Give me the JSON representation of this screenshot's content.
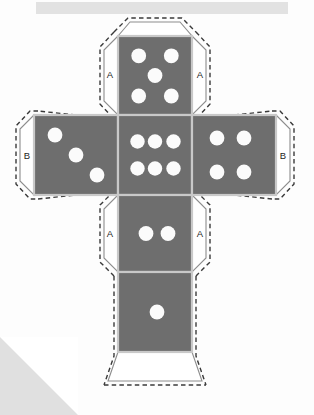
{
  "document": {
    "title": "Dice Cube Net Cut-Out",
    "description": "Unfolded net of a six-sided die with glue flaps labelled A and B",
    "background_color": "#fdfdfd",
    "face_color": "#6e6e6e",
    "pip_color": "#fbfbfb",
    "fold_line_color": "#c9c9c9",
    "flap_outline_color": "#8d8d8d",
    "cut_line_color": "#3a3a3a",
    "decor_gray": "#e2e2e2"
  },
  "net": {
    "grid": {
      "col_left_x": 34,
      "col_center_x": 118,
      "col_right_x": 192,
      "col_right_end_x": 276,
      "row_top_y": 36,
      "row_mid_y": 115,
      "row_lower_y": 195,
      "row_bottom_y": 272,
      "row_bottom_end_y": 352,
      "cell_w": 74,
      "cell_h": 79
    },
    "faces": [
      {
        "id": "face-top",
        "name": "face-five",
        "pip_count": 5,
        "x": 118,
        "y": 36,
        "w": 74,
        "h": 79,
        "pips": [
          [
            0.28,
            0.25
          ],
          [
            0.72,
            0.25
          ],
          [
            0.5,
            0.5
          ],
          [
            0.28,
            0.76
          ],
          [
            0.72,
            0.76
          ]
        ]
      },
      {
        "id": "face-left",
        "name": "face-three",
        "pip_count": 3,
        "x": 34,
        "y": 115,
        "w": 84,
        "h": 80,
        "pips": [
          [
            0.25,
            0.25
          ],
          [
            0.5,
            0.5
          ],
          [
            0.75,
            0.76
          ]
        ]
      },
      {
        "id": "face-center",
        "name": "face-six",
        "pip_count": 6,
        "x": 118,
        "y": 115,
        "w": 74,
        "h": 80,
        "pips": [
          [
            0.26,
            0.33
          ],
          [
            0.5,
            0.33
          ],
          [
            0.74,
            0.33
          ],
          [
            0.26,
            0.67
          ],
          [
            0.5,
            0.67
          ],
          [
            0.74,
            0.67
          ]
        ]
      },
      {
        "id": "face-right",
        "name": "face-four",
        "pip_count": 4,
        "x": 192,
        "y": 115,
        "w": 84,
        "h": 80,
        "pips": [
          [
            0.3,
            0.28
          ],
          [
            0.62,
            0.28
          ],
          [
            0.3,
            0.72
          ],
          [
            0.62,
            0.72
          ]
        ]
      },
      {
        "id": "face-lower",
        "name": "face-two",
        "pip_count": 2,
        "x": 118,
        "y": 195,
        "w": 74,
        "h": 77,
        "pips": [
          [
            0.38,
            0.5
          ],
          [
            0.62,
            0.5
          ]
        ]
      },
      {
        "id": "face-bottom",
        "name": "face-one",
        "pip_count": 1,
        "x": 118,
        "y": 272,
        "w": 74,
        "h": 80,
        "pips": [
          [
            0.5,
            0.5
          ]
        ]
      }
    ],
    "flaps": [
      {
        "id": "flap-top-left",
        "label": "A",
        "label_x": 107,
        "label_y": 74
      },
      {
        "id": "flap-top-right",
        "label": "A",
        "label_x": 203,
        "label_y": 74
      },
      {
        "id": "flap-left-outer",
        "label": "B",
        "label_x": 24,
        "label_y": 155
      },
      {
        "id": "flap-right-outer",
        "label": "B",
        "label_x": 286,
        "label_y": 155
      },
      {
        "id": "flap-lower-left",
        "label": "A",
        "label_x": 107,
        "label_y": 235
      },
      {
        "id": "flap-lower-right",
        "label": "A",
        "label_x": 203,
        "label_y": 235
      },
      {
        "id": "flap-bottom-tab",
        "label": "",
        "label_x": 155,
        "label_y": 372
      }
    ],
    "flap_labels": [
      "A",
      "A",
      "B",
      "B",
      "A",
      "A"
    ]
  }
}
